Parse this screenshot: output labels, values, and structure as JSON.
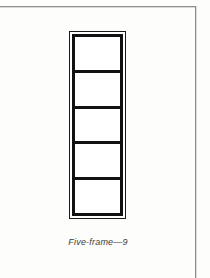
{
  "page": {
    "background_color": "#fdfdfc",
    "width": 210,
    "height": 278
  },
  "edge_rules": {
    "color": "#8e8e8e",
    "top_rule_name": "page-edge-top-rule",
    "right_rule_name": "page-edge-right-rule"
  },
  "figure": {
    "title": "Five-frame",
    "type": "line-drawing",
    "orientation": "vertical",
    "pane_count": 5,
    "outer_border_color": "#1a1a1a",
    "inner_border_color": "#111111",
    "fill_color": "#ffffff",
    "panes": [
      {
        "index": 1,
        "label": ""
      },
      {
        "index": 2,
        "label": ""
      },
      {
        "index": 3,
        "label": ""
      },
      {
        "index": 4,
        "label": ""
      },
      {
        "index": 5,
        "label": ""
      }
    ]
  },
  "caption": {
    "text": "Five-frame—9",
    "style": "italic",
    "color": "#3b3b3b"
  }
}
